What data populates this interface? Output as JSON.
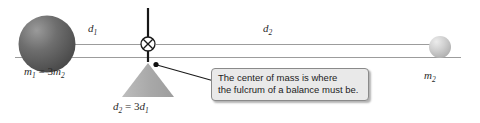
{
  "figure": {
    "type": "physics-diagram",
    "background_color": "#ffffff",
    "callout": {
      "text": "The center of mass is where\nthe fulcrum of a balance must be.",
      "fill_color": "#e9e9e9",
      "border_color": "#8a8a8a"
    },
    "labels": {
      "d1": {
        "symbol": "d",
        "subscript": "1"
      },
      "d2": {
        "symbol": "d",
        "subscript": "2"
      },
      "m1_equation": {
        "lhs_symbol": "m",
        "lhs_sub": "1",
        "operator": "=",
        "coefficient": "3",
        "rhs_symbol": "m",
        "rhs_sub": "2"
      },
      "m2": {
        "symbol": "m",
        "subscript": "2"
      },
      "d_equation": {
        "lhs_symbol": "d",
        "lhs_sub": "2",
        "operator": "=",
        "coefficient": "3",
        "rhs_symbol": "d",
        "rhs_sub": "1"
      }
    },
    "elements": {
      "large_sphere": {
        "name": "mass-m1-sphere",
        "cx": 47,
        "cy": 44,
        "r": 28,
        "color_dark": "#555555",
        "color_light": "#9a9a9a"
      },
      "small_sphere": {
        "name": "mass-m2-sphere",
        "cx": 440,
        "cy": 47,
        "r": 11,
        "color_dark": "#b4b4b4",
        "color_light": "#e2e2e2"
      },
      "center_of_mass_marker": {
        "name": "center-of-mass-symbol",
        "cx": 148,
        "cy": 44,
        "r": 7
      },
      "fulcrum_triangle": {
        "name": "fulcrum-triangle",
        "apex_x": 148,
        "apex_y": 63,
        "base_left_x": 122,
        "base_right_x": 174,
        "base_y": 97,
        "color": "#aeaeae"
      },
      "vertical_rod": {
        "x": 148,
        "y_top": 8,
        "y_bottom": 44,
        "color": "#171717"
      },
      "baseline": {
        "x1": 15,
        "x2": 461,
        "y": 57,
        "color": "#9c9c9c"
      },
      "beam_line": {
        "x1": 47,
        "x2": 440,
        "y": 44,
        "color": "#9c9c9c"
      },
      "leader_line": {
        "x1": 155,
        "y1": 64,
        "x2": 213,
        "y2": 80,
        "dot_r": 2.4,
        "color": "#1a1a1a"
      }
    }
  }
}
